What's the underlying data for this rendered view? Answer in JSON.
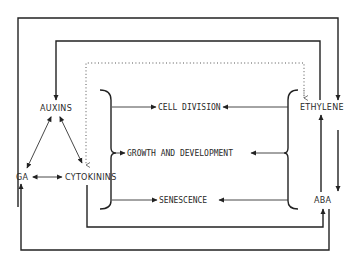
{
  "diagram": {
    "title": "",
    "nodes": {
      "auxins": "AUXINS",
      "ga": "GA",
      "cytokinins": "CYTOKININS",
      "ethylene": "ETHYLENE",
      "aba": "ABA"
    },
    "processes": {
      "cell_division": "CELL DIVISION",
      "growth_development": "GROWTH AND DEVELOPMENT",
      "senescence": "SENESCENCE"
    },
    "edges": [
      {
        "from": "auxins",
        "to": "ga",
        "type": "bidirectional"
      },
      {
        "from": "auxins",
        "to": "cytokinins",
        "type": "bidirectional"
      },
      {
        "from": "ga",
        "to": "cytokinins",
        "type": "bidirectional"
      },
      {
        "from": "ga",
        "to": "ethylene",
        "type": "directed",
        "route": "outer top loop"
      },
      {
        "from": "ethylene",
        "to": "auxins",
        "type": "directed",
        "route": "inner top loop"
      },
      {
        "from": "ethylene",
        "to": "cytokinins",
        "type": "dotted"
      },
      {
        "from": "ethylene",
        "to": "aba",
        "type": "bidirectional"
      },
      {
        "from": "cytokinins",
        "to": "aba",
        "type": "directed",
        "route": "inner bottom loop"
      },
      {
        "from": "ga",
        "to": "aba",
        "type": "directed",
        "route": "outer bottom loop"
      },
      {
        "from": "auxins_cytokinins_group",
        "to": "cell_division",
        "type": "directed"
      },
      {
        "from": "auxins_cytokinins_group",
        "to": "growth_development",
        "type": "directed"
      },
      {
        "from": "auxins_cytokinins_group",
        "to": "senescence",
        "type": "directed"
      },
      {
        "from": "ethylene_aba_group",
        "to": "cell_division",
        "type": "directed"
      },
      {
        "from": "ethylene_aba_group",
        "to": "growth_development",
        "type": "directed"
      },
      {
        "from": "ethylene_aba_group",
        "to": "senescence",
        "type": "directed"
      }
    ]
  }
}
